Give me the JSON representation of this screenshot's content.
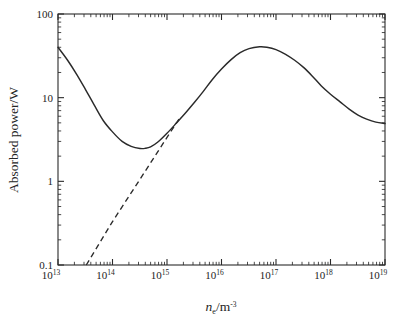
{
  "figure": {
    "background_color": "#ffffff",
    "line_color": "#2a2a2a",
    "frame_color": "#2a2a2a"
  },
  "axes": {
    "y_title": "Absorbed power/W",
    "x_title_symbol": "n",
    "x_title_subscript": "e",
    "x_title_separator": "/m",
    "x_title_superscript": "-3",
    "x_title_full": "n_e/m^-3",
    "x_tick_labels": [
      {
        "mantissa": "10",
        "exponent": "13"
      },
      {
        "mantissa": "10",
        "exponent": "14"
      },
      {
        "mantissa": "10",
        "exponent": "15"
      },
      {
        "mantissa": "10",
        "exponent": "16"
      },
      {
        "mantissa": "10",
        "exponent": "17"
      },
      {
        "mantissa": "10",
        "exponent": "18"
      },
      {
        "mantissa": "10",
        "exponent": "19"
      }
    ],
    "y_tick_labels": [
      "100",
      "10",
      "1",
      "0.1"
    ]
  },
  "chart_data": {
    "type": "line",
    "title": "",
    "xlabel": "n_e/m^-3",
    "ylabel": "Absorbed power/W",
    "xscale": "log",
    "yscale": "log",
    "xlim": [
      10000000000000.0,
      1e+19
    ],
    "ylim": [
      0.1,
      100
    ],
    "grid": false,
    "legend": "none",
    "xticks": [
      10000000000000.0,
      100000000000000.0,
      1000000000000000.0,
      1e+16,
      1e+17,
      1e+18,
      1e+19
    ],
    "yticks": [
      0.1,
      1,
      10,
      100
    ],
    "series": [
      {
        "name": "Absorbed power (full model)",
        "style": "solid",
        "color": "#2a2a2a",
        "x": [
          10000000000000.0,
          15000000000000.0,
          22000000000000.0,
          32000000000000.0,
          46000000000000.0,
          68000000000000.0,
          100000000000000.0,
          150000000000000.0,
          220000000000000.0,
          320000000000000.0,
          400000000000000.0,
          500000000000000.0,
          680000000000000.0,
          1000000000000000.0,
          1500000000000000.0,
          2200000000000000.0,
          3200000000000000.0,
          4600000000000000.0,
          6800000000000000.0,
          1e+16,
          1.5e+16,
          2.2e+16,
          3.2e+16,
          5e+16,
          6.8e+16,
          1e+17,
          1.5e+17,
          2.2e+17,
          3.2e+17,
          4.6e+17,
          6.8e+17,
          1e+18,
          1.5e+18,
          2.2e+18,
          3.2e+18,
          4.6e+18,
          6.8e+18,
          1e+19
        ],
        "y": [
          40.0,
          28.0,
          19.0,
          12.5,
          8.2,
          5.3,
          3.9,
          3.0,
          2.62,
          2.47,
          2.48,
          2.58,
          2.95,
          3.75,
          5.0,
          6.6,
          8.8,
          11.8,
          16.5,
          22.0,
          28.5,
          34.5,
          38.5,
          40.5,
          40.0,
          37.5,
          33.0,
          28.0,
          23.0,
          18.2,
          13.8,
          11.0,
          8.9,
          7.3,
          6.2,
          5.55,
          5.1,
          4.9
        ]
      },
      {
        "name": "Asymptotic (collisional) limit",
        "style": "dashed",
        "color": "#2a2a2a",
        "x": [
          33000000000000.0,
          100000000000000.0,
          320000000000000.0,
          1000000000000000.0,
          1800000000000000.0
        ],
        "y": [
          0.1,
          0.33,
          1.06,
          3.35,
          6.0
        ]
      }
    ],
    "annotations": [
      {
        "text": "curve minimum",
        "x": 400000000000000.0,
        "y": 2.47
      },
      {
        "text": "curve maximum",
        "x": 5e+16,
        "y": 40.5
      }
    ]
  }
}
